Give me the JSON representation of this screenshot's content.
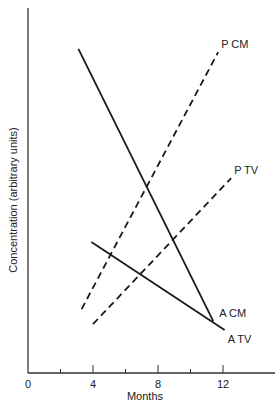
{
  "chart_data": {
    "type": "line",
    "title": "",
    "xlabel": "Months",
    "ylabel": "Concentration (arbitrary units)",
    "xlim": [
      0,
      14.2
    ],
    "ylim": [
      0,
      100
    ],
    "x_ticks": [
      0,
      2,
      4,
      6,
      8,
      10,
      12
    ],
    "x_tick_labels": [
      "0",
      "",
      "4",
      "",
      "8",
      "",
      "12"
    ],
    "grid": false,
    "legend": "inline labels at line ends",
    "series": [
      {
        "name": "A CM",
        "style": "solid",
        "x": [
          3.1,
          11.4
        ],
        "y": [
          88.8,
          14.2
        ],
        "label_pos": "end-right"
      },
      {
        "name": "A TV",
        "style": "solid",
        "x": [
          3.9,
          12.1
        ],
        "y": [
          35.9,
          11.8
        ],
        "label_pos": "end-below"
      },
      {
        "name": "P CM",
        "style": "dashed",
        "x": [
          3.3,
          11.7
        ],
        "y": [
          17.5,
          87.9
        ],
        "label_pos": "end-above"
      },
      {
        "name": "P TV",
        "style": "dashed",
        "x": [
          4.0,
          12.5
        ],
        "y": [
          13.4,
          53.4
        ],
        "label_pos": "end-above"
      }
    ]
  },
  "colors": {
    "line": "#1a1a1a",
    "axis": "#333333",
    "text": "#222222",
    "background": "#ffffff"
  }
}
